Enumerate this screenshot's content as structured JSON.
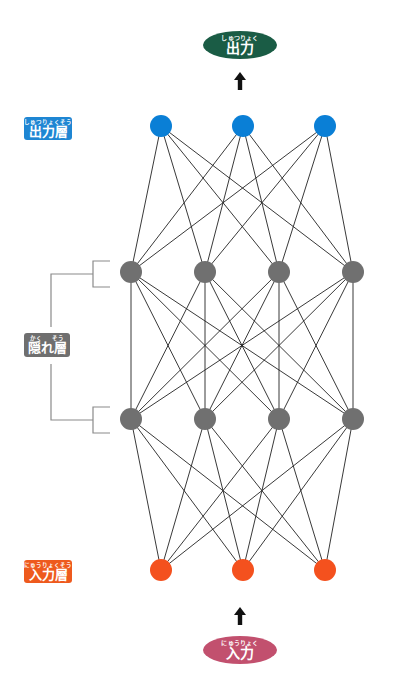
{
  "colors": {
    "output_node": "#0a7fd6",
    "hidden_node": "#707070",
    "input_node": "#f4511e",
    "edge": "#222222",
    "bracket": "#8a8a8a",
    "output_pill": "#1a5c45",
    "input_pill": "#c2506e",
    "output_label_bg": "#1e86d3",
    "hidden_label_bg": "#6f6f6f",
    "input_label_bg": "#ee5a1e",
    "arrow": "#111111"
  },
  "output_pill": {
    "ruby": "しゅつりょく",
    "text": "出力"
  },
  "input_pill": {
    "ruby": "にゅうりょく",
    "text": "入力"
  },
  "labels": {
    "output_layer": {
      "ruby": "しゅつりょくそう",
      "text": "出力層"
    },
    "hidden_layer": {
      "ruby_left": "かく",
      "ruby_right": "そう",
      "text": "隠れ層"
    },
    "input_layer": {
      "ruby": "にゅうりょくそう",
      "text": "入力層"
    }
  },
  "network": {
    "layers": [
      {
        "name": "output",
        "nodes": 3
      },
      {
        "name": "hidden-1",
        "nodes": 4
      },
      {
        "name": "hidden-2",
        "nodes": 4
      },
      {
        "name": "input",
        "nodes": 3
      }
    ],
    "connections": "fully-connected between adjacent layers"
  }
}
